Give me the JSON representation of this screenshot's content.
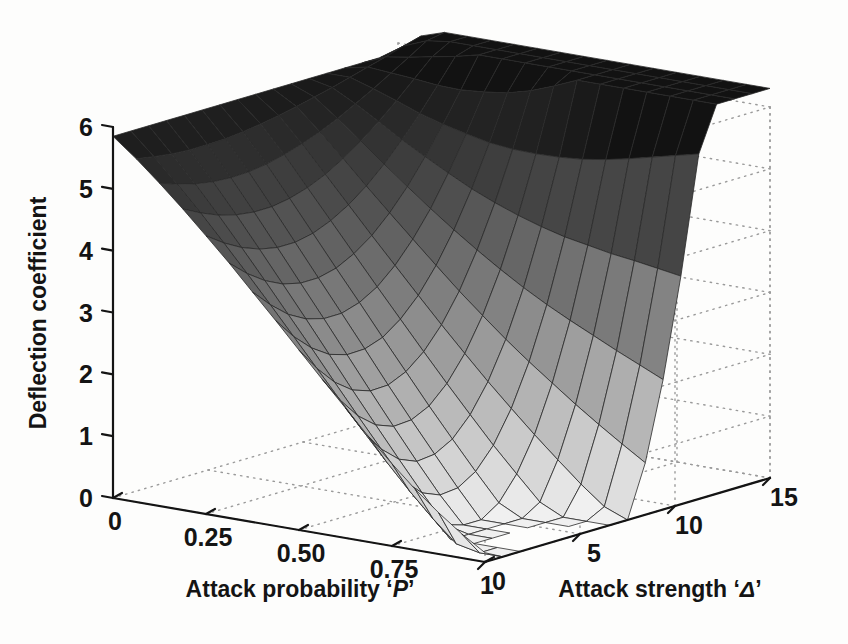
{
  "figure": {
    "background_color": "#fdfdfc",
    "ink_color": "#141414",
    "grid_color": "#9a9a9a",
    "grid_style": "dotted"
  },
  "chart_data": {
    "type": "surface",
    "title": "",
    "xlabel": "Attack probability 'P'",
    "ylabel": "Attack strength 'Δ'",
    "zlabel": "Deflection coefficient",
    "xlabel_plain": "Attack probability",
    "xlabel_symbol": "P",
    "ylabel_plain": "Attack strength",
    "ylabel_symbol": "Δ",
    "xticks": [
      "0",
      "0.25",
      "0.50",
      "0.75",
      "1"
    ],
    "xtick_values": [
      0,
      0.25,
      0.5,
      0.75,
      1
    ],
    "yticks": [
      "0",
      "5",
      "10",
      "15"
    ],
    "ytick_values": [
      0,
      5,
      10,
      15
    ],
    "zticks": [
      "0",
      "1",
      "2",
      "3",
      "4",
      "5",
      "6"
    ],
    "ztick_values": [
      0,
      1,
      2,
      3,
      4,
      5,
      6
    ],
    "xlim": [
      0,
      1
    ],
    "ylim": [
      0,
      15
    ],
    "zlim": [
      0,
      6
    ],
    "grid": true,
    "legend": false,
    "colormap": "gray",
    "mesh_visible": true,
    "x": [
      0,
      0.0625,
      0.125,
      0.1875,
      0.25,
      0.3125,
      0.375,
      0.4375,
      0.5,
      0.5625,
      0.625,
      0.6875,
      0.75,
      0.8125,
      0.875,
      0.9375,
      1
    ],
    "y": [
      0,
      0.9375,
      1.875,
      2.8125,
      3.75,
      4.6875,
      5.625,
      6.5625,
      7.5,
      8.4375,
      9.375,
      10.3125,
      11.25,
      12.1875,
      13.125,
      14.0625,
      15
    ],
    "z_description": "Deflection coefficient surface: maximal (~6) along P=0 edge, falls to a minimum near 0 in the region of high P and mid attack strength, then rises again toward high attack strength (~3 at P=1, delta=15).",
    "z_corner_values": {
      "P0_D0": 5.85,
      "P0_D15": 5.85,
      "P1_D0": 0.15,
      "P1_D15": 3.1
    },
    "z": [
      [
        5.85,
        5.85,
        5.85,
        5.85,
        5.85,
        5.85,
        5.85,
        5.85,
        5.85,
        5.85,
        5.85,
        5.85,
        5.85,
        5.85,
        5.85,
        5.85,
        5.85
      ],
      [
        5.55,
        5.5,
        5.46,
        5.44,
        5.44,
        5.45,
        5.48,
        5.52,
        5.57,
        5.63,
        5.7,
        5.77,
        5.85,
        5.93,
        6.01,
        6.1,
        6.18
      ],
      [
        5.22,
        5.12,
        5.04,
        4.99,
        4.97,
        4.98,
        5.02,
        5.09,
        5.18,
        5.29,
        5.42,
        5.57,
        5.73,
        5.9,
        6.07,
        6.25,
        6.42
      ],
      [
        4.87,
        4.72,
        4.6,
        4.52,
        4.48,
        4.48,
        4.53,
        4.62,
        4.75,
        4.92,
        5.12,
        5.35,
        5.6,
        5.87,
        6.14,
        6.42,
        6.7
      ],
      [
        4.5,
        4.3,
        4.14,
        4.03,
        3.97,
        3.97,
        4.03,
        4.15,
        4.32,
        4.54,
        4.81,
        5.12,
        5.46,
        5.83,
        6.21,
        6.6,
        6.99
      ],
      [
        4.12,
        3.87,
        3.67,
        3.53,
        3.46,
        3.46,
        3.53,
        3.68,
        3.89,
        4.17,
        4.51,
        4.91,
        5.35,
        5.82,
        6.31,
        6.82,
        7.33
      ],
      [
        3.72,
        3.43,
        3.19,
        3.03,
        2.95,
        2.95,
        3.04,
        3.21,
        3.47,
        3.81,
        4.22,
        4.71,
        5.26,
        5.85,
        6.47,
        7.11,
        7.76
      ],
      [
        3.32,
        2.98,
        2.71,
        2.52,
        2.43,
        2.44,
        2.54,
        2.75,
        3.05,
        3.45,
        3.94,
        4.52,
        5.18,
        5.9,
        6.67,
        7.47,
        8.28
      ],
      [
        2.91,
        2.53,
        2.22,
        2.01,
        1.91,
        1.92,
        2.05,
        2.29,
        2.64,
        3.1,
        3.68,
        4.36,
        5.14,
        6.0,
        6.92,
        7.89,
        8.88
      ],
      [
        2.5,
        2.08,
        1.74,
        1.51,
        1.4,
        1.42,
        1.56,
        1.84,
        2.24,
        2.77,
        3.43,
        4.22,
        5.13,
        6.14,
        7.23,
        8.38,
        9.57
      ],
      [
        2.1,
        1.64,
        1.27,
        1.02,
        0.9,
        0.93,
        1.09,
        1.4,
        1.85,
        2.45,
        3.2,
        4.1,
        5.14,
        6.3,
        7.58,
        8.94,
        10.35
      ],
      [
        1.7,
        1.21,
        0.81,
        0.54,
        0.42,
        0.45,
        0.63,
        0.97,
        1.48,
        2.15,
        2.99,
        4.0,
        5.17,
        6.49,
        7.96,
        9.55,
        11.21
      ],
      [
        1.33,
        0.8,
        0.38,
        0.09,
        -0.04,
        -0.01,
        0.19,
        0.57,
        1.12,
        1.87,
        2.8,
        3.93,
        5.23,
        6.71,
        8.37,
        10.2,
        12.14
      ],
      [
        0.98,
        0.42,
        -0.03,
        -0.33,
        -0.47,
        -0.44,
        -0.23,
        0.18,
        0.78,
        1.59,
        2.62,
        3.86,
        5.31,
        6.95,
        8.8,
        10.89,
        13.12
      ],
      [
        0.67,
        0.08,
        -0.39,
        -0.71,
        -0.86,
        -0.83,
        -0.61,
        -0.2,
        0.45,
        1.33,
        2.44,
        3.81,
        5.4,
        7.2,
        9.26,
        11.6,
        14.15
      ],
      [
        0.39,
        -0.22,
        -0.71,
        -1.05,
        -1.21,
        -1.18,
        -0.95,
        -0.52,
        0.15,
        1.08,
        2.27,
        3.75,
        5.49,
        7.47,
        9.73,
        12.34,
        15.22
      ],
      [
        0.15,
        -0.48,
        -0.99,
        -1.34,
        -1.51,
        -1.48,
        -1.24,
        -0.8,
        -0.13,
        0.84,
        2.1,
        3.69,
        5.58,
        7.74,
        10.22,
        13.09,
        16.32
      ]
    ]
  }
}
